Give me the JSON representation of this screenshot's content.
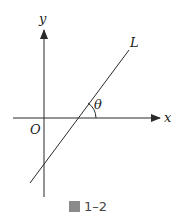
{
  "figure": {
    "caption_prefix_icon": "figure-char-icon",
    "caption": "1–2",
    "labels": {
      "y_axis": "y",
      "x_axis": "x",
      "origin": "O",
      "line": "L",
      "angle": "θ"
    },
    "colors": {
      "stroke": "#2a2a2a",
      "background": "#ffffff"
    }
  }
}
